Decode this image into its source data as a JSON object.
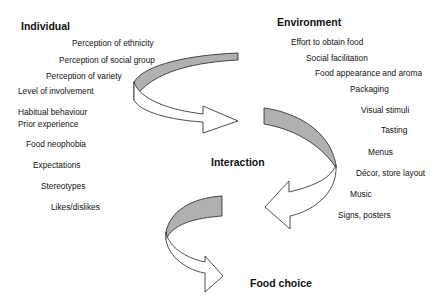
{
  "headings": {
    "individual": "Individual",
    "environment": "Environment",
    "interaction": "Interaction",
    "food_choice": "Food choice"
  },
  "individual_factors": [
    "Perception of ethnicity",
    "Perception of social group",
    "Perception of variety",
    "Level of involvement",
    "Habitual behaviour",
    "Prior experience",
    "Food neophobia",
    "Expectations",
    "Stereotypes",
    "Likes/dislikes"
  ],
  "environment_factors": [
    "Effort to obtain food",
    "Social facilitation",
    "Food appearance and aroma",
    "Packaging",
    "Visual stimuli",
    "Tasting",
    "Menus",
    "Décor, store layout",
    "Music",
    "Signs, posters"
  ],
  "colors": {
    "arrow_shade": "#b0b0b0",
    "arrow_fill": "#ffffff",
    "stroke": "#222222",
    "text": "#111111"
  }
}
